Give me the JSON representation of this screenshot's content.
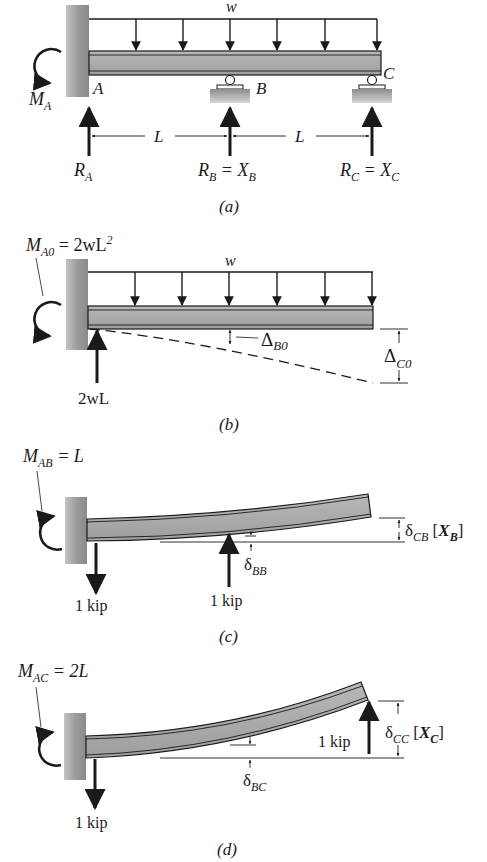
{
  "panels": {
    "a": {
      "caption": "(a)",
      "load": "w",
      "moment": {
        "main": "M",
        "sub": "A"
      },
      "point_a": "A",
      "point_b": "B",
      "point_c": "C",
      "span1": "L",
      "span2": "L",
      "ra": {
        "main": "R",
        "sub": "A"
      },
      "rb": {
        "main": "R",
        "sub": "B",
        "eq": " = X",
        "sub2": "B"
      },
      "rc": {
        "main": "R",
        "sub": "C",
        "eq": " = X",
        "sub2": "C"
      }
    },
    "b": {
      "caption": "(b)",
      "load": "w",
      "moment": {
        "main": "M",
        "sub": "A0",
        "eq": " = 2wL",
        "sup": "2"
      },
      "reaction": "2wL",
      "delta_b": {
        "main": "Δ",
        "sub": "B0"
      },
      "delta_c": {
        "main": "Δ",
        "sub": "C0"
      }
    },
    "c": {
      "caption": "(c)",
      "moment": {
        "main": "M",
        "sub": "AB",
        "eq": " = L"
      },
      "wall_force": "1 kip",
      "applied_force": "1 kip",
      "delta_bb": {
        "main": "δ",
        "sub": "BB"
      },
      "delta_cb": {
        "main": "δ",
        "sub": "CB",
        "bracket_open": " [",
        "x": "X",
        "xsub": "B",
        "bracket_close": "]"
      }
    },
    "d": {
      "caption": "(d)",
      "moment": {
        "main": "M",
        "sub": "AC",
        "eq": " = 2L"
      },
      "wall_force": "1 kip",
      "applied_force": "1 kip",
      "delta_bc": {
        "main": "δ",
        "sub": "BC"
      },
      "delta_cc": {
        "main": "δ",
        "sub": "CC",
        "bracket_open": " [",
        "x": "X",
        "xsub": "C",
        "bracket_close": "]"
      }
    }
  },
  "colors": {
    "ink": "#1a1a1a",
    "beam_fill": "#a9a9a9",
    "wall_fill": "#9a9a9a",
    "background": "#ffffff"
  }
}
